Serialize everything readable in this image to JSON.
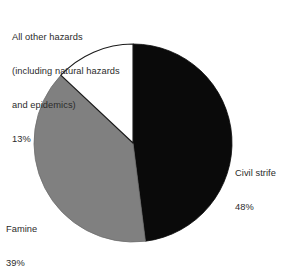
{
  "chart_data": {
    "type": "pie",
    "title": "",
    "subtitle": "",
    "xlabel": "",
    "ylabel": "",
    "legend_position": "none",
    "grid": false,
    "units": "percent",
    "start_angle_deg": 0,
    "direction": "clockwise",
    "categories": [
      "Civil strife",
      "Famine",
      "All other hazards (including natural hazards and epidemics)"
    ],
    "values": [
      48,
      39,
      13
    ],
    "slices": [
      {
        "label": "Civil strife",
        "value": 48,
        "value_text": "48%",
        "color": "#0a0a0a",
        "stroke": "#0a0a0a"
      },
      {
        "label": "Famine",
        "value": 39,
        "value_text": "39%",
        "color": "#808080",
        "stroke": "#6e6e6e"
      },
      {
        "label": "All other hazards (including natural hazards and epidemics)",
        "value": 13,
        "value_text": "13%",
        "color": "#ffffff",
        "stroke": "#1a1a1a"
      }
    ]
  },
  "labels": {
    "other_hazards": {
      "line1": "All other hazards",
      "line2": "(including natural hazards",
      "line3": "and epidemics)",
      "value": "13%"
    },
    "civil_strife": {
      "name": "Civil strife",
      "value": "48%"
    },
    "famine": {
      "name": "Famine",
      "value": "39%"
    }
  },
  "colors": {
    "background": "#ffffff",
    "text": "#2b2b2b",
    "slice_civil_strife": "#0a0a0a",
    "slice_famine": "#808080",
    "slice_other": "#ffffff",
    "outline": "#1a1a1a"
  }
}
